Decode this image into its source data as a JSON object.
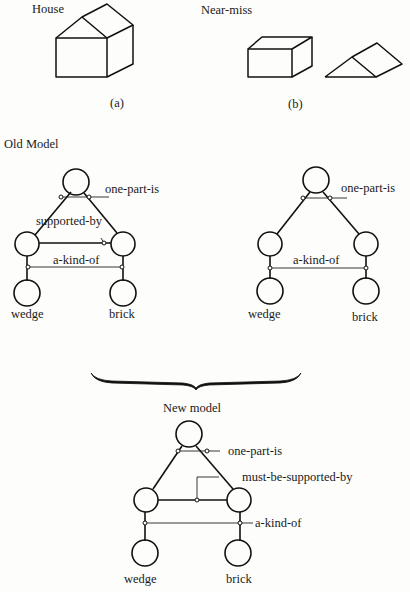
{
  "figure": {
    "panel_a": {
      "title": "House",
      "caption": "(a)"
    },
    "panel_b": {
      "title": "Near-miss",
      "caption": "(b)"
    },
    "old_model": {
      "title": "Old Model",
      "relations": {
        "one_part_is": "one-part-is",
        "supported_by": "supported-by",
        "a_kind_of": "a-kind-of"
      },
      "leaves": {
        "left": "wedge",
        "right": "brick"
      }
    },
    "near_miss_model": {
      "relations": {
        "one_part_is": "one-part-is",
        "a_kind_of": "a-kind-of"
      },
      "leaves": {
        "left": "wedge",
        "right": "brick"
      }
    },
    "new_model": {
      "title": "New model",
      "relations": {
        "one_part_is": "one-part-is",
        "must_be_supported_by": "must-be-supported-by",
        "a_kind_of": "a-kind-of"
      },
      "leaves": {
        "left": "wedge",
        "right": "brick"
      }
    }
  }
}
